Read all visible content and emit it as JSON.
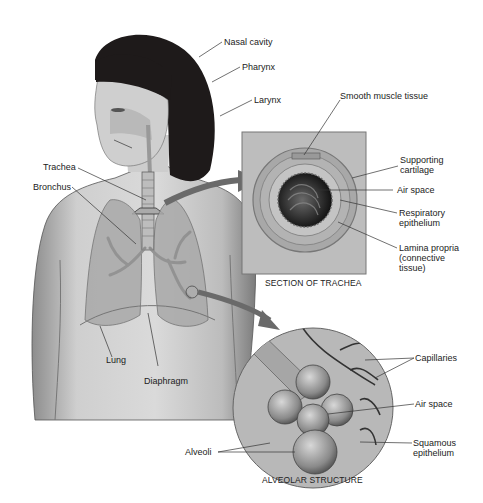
{
  "figure": {
    "main_labels": {
      "nasal_cavity": "Nasal cavity",
      "pharynx": "Pharynx",
      "larynx": "Larynx",
      "trachea": "Trachea",
      "bronchus": "Bronchus",
      "lung": "Lung",
      "diaphragm": "Diaphragm"
    },
    "trachea_section": {
      "caption": "SECTION OF TRACHEA",
      "labels": {
        "smooth_muscle": "Smooth muscle tissue",
        "supporting_cartilage_1": "Supporting",
        "supporting_cartilage_2": "cartilage",
        "air_space": "Air space",
        "respiratory_epithelium_1": "Respiratory",
        "respiratory_epithelium_2": "epithelium",
        "lamina_propria_1": "Lamina propria",
        "lamina_propria_2": "(connective",
        "lamina_propria_3": "tissue)"
      }
    },
    "alveolar_structure": {
      "caption": "ALVEOLAR STRUCTURE",
      "labels": {
        "capillaries": "Capillaries",
        "air_space": "Air space",
        "squamous_epithelium_1": "Squamous",
        "squamous_epithelium_2": "epithelium",
        "alveoli": "Alveoli"
      }
    },
    "colors": {
      "skin": "#c9c9c9",
      "hair": "#1e1a1a",
      "line": "#333333",
      "inset_bg": "#bdbdbd",
      "arrow": "#555555"
    }
  }
}
